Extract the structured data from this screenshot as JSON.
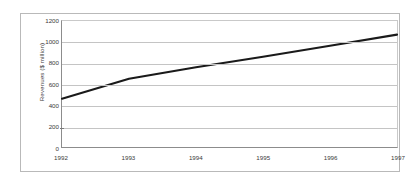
{
  "chart_data": {
    "type": "line",
    "title": "",
    "xlabel": "",
    "ylabel": "Revenues ($ million)",
    "x": [
      "1992",
      "1993",
      "1994",
      "1995",
      "1996",
      "1997"
    ],
    "values": [
      460,
      650,
      760,
      860,
      965,
      1070
    ],
    "series": [
      {
        "name": "Revenues",
        "values": [
          460,
          650,
          760,
          860,
          965,
          1070
        ],
        "color": "#1a1a1a"
      }
    ],
    "xtick_labels": [
      "1992",
      "1993",
      "1994",
      "1995",
      "1996",
      "1997"
    ],
    "ytick_labels": [
      "0",
      "200",
      "400",
      "600",
      "800",
      "1000",
      "1200"
    ],
    "ytick_values": [
      0,
      200,
      400,
      600,
      800,
      1000,
      1200
    ],
    "ylim": [
      0,
      1200
    ],
    "xlim": [
      1992,
      1997
    ],
    "grid": true,
    "grid_axis": "y",
    "legend": false,
    "legend_position": "none",
    "line_color": "#1a1a1a",
    "grid_color": "#c4c4c4",
    "axis_color": "#8c8c8c",
    "text_color": "#3a3a3a",
    "frame_border_color": "#b9b9b9",
    "background": "#ffffff"
  }
}
